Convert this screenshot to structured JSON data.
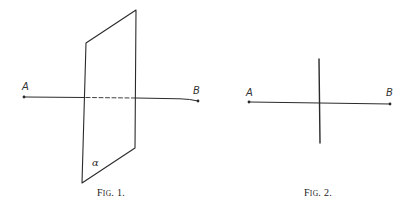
{
  "figures": [
    {
      "id": "fig1",
      "caption": {
        "prefix": "F",
        "smallcaps": "IG",
        "suffix": ". 1."
      },
      "plane": {
        "label": "α",
        "vertices": [
          [
            86,
            43
          ],
          [
            136,
            10
          ],
          [
            135,
            148
          ],
          [
            82,
            183
          ]
        ]
      },
      "segment": {
        "start_label": "A",
        "end_label": "B",
        "start": [
          24,
          97
        ],
        "end": [
          198,
          101
        ],
        "hidden_part_style": "dashed"
      }
    },
    {
      "id": "fig2",
      "caption": {
        "prefix": "F",
        "smallcaps": "IG",
        "suffix": ". 2."
      },
      "trace_line": {
        "top": [
          319,
          59
        ],
        "bottom": [
          320,
          143
        ]
      },
      "segment": {
        "start_label": "A",
        "end_label": "B",
        "start": [
          249,
          102
        ],
        "end": [
          390,
          104
        ]
      }
    }
  ],
  "colors": {
    "ink": "#2a2a2a",
    "background": "#ffffff"
  }
}
